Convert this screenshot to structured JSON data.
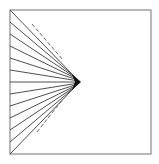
{
  "diagram": {
    "type": "line-fan",
    "frame": {
      "x": 10,
      "y": 10,
      "width": 141,
      "height": 144,
      "stroke": "#8a8a8a"
    },
    "focus_point": {
      "x": 79,
      "y": 82
    },
    "ray_color": "#3a3a3a",
    "ray_origins_y": [
      10,
      22,
      34,
      46,
      58,
      70,
      82,
      94,
      106,
      118,
      130,
      142,
      154
    ],
    "dashed_lines": [
      {
        "x1": 32,
        "y1": 24,
        "x2": 63,
        "y2": 60
      },
      {
        "x1": 37,
        "y1": 132,
        "x2": 63,
        "y2": 99
      }
    ],
    "dashed_color": "#555555"
  }
}
